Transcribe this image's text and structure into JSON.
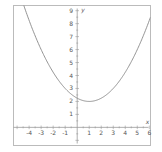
{
  "chart_data": {
    "type": "line",
    "title": "",
    "xlabel": "x",
    "ylabel": "y",
    "xlim": [
      -5.3,
      6.1
    ],
    "ylim": [
      -1.4,
      9.4
    ],
    "grid": false,
    "x_ticks": [
      -4,
      -3,
      -2,
      -1,
      1,
      2,
      3,
      4,
      5,
      6
    ],
    "y_ticks": [
      1,
      2,
      3,
      4,
      5,
      6,
      7,
      8,
      9
    ],
    "series": [
      {
        "name": "y = 0.25(x-1)^2 + 2",
        "function": {
          "a": 0.25,
          "h": 1,
          "k": 2
        },
        "x_domain": [
          -4.5,
          6.1
        ],
        "color": "#888888"
      }
    ],
    "vertex": [
      1,
      2
    ],
    "colors": {
      "axis": "#999999",
      "frame": "#bbbbbb",
      "curve": "#888888",
      "text": "#555555"
    }
  }
}
